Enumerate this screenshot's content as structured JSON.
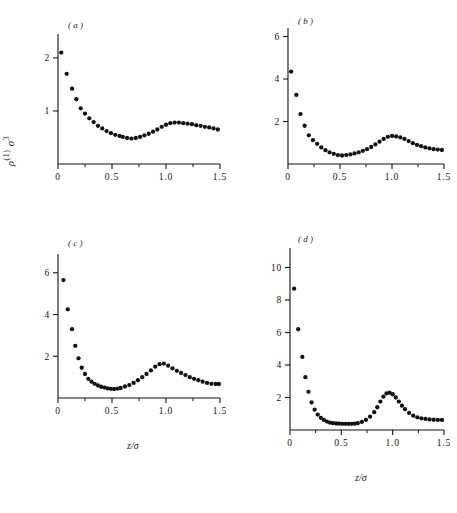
{
  "figure": {
    "ylabel_rho": "ρ",
    "ylabel_sup": "(1)",
    "ylabel_sigma": "σ",
    "ylabel_sigma_sup": "3",
    "xlabel_main": "z/σ",
    "background": "#ffffff",
    "ink": "#111111"
  },
  "chart_data": [
    {
      "type": "scatter",
      "panel": "(a)",
      "title": "",
      "xlabel": "z/σ",
      "ylabel": "ρ(1)σ3",
      "xlim": [
        0,
        1.5
      ],
      "ylim": [
        0,
        2.45
      ],
      "xticks": [
        0,
        0.5,
        1.0,
        1.5
      ],
      "xticklabels": [
        "0",
        "0.5",
        "1.0",
        "1.5"
      ],
      "xminorticks": [
        0.25,
        0.75,
        1.25
      ],
      "yticks": [
        1,
        2
      ],
      "yticklabels": [
        "1",
        "2"
      ],
      "grid": false,
      "legend": false,
      "x": [
        0.03,
        0.08,
        0.13,
        0.17,
        0.21,
        0.25,
        0.29,
        0.33,
        0.37,
        0.41,
        0.45,
        0.49,
        0.53,
        0.57,
        0.6,
        0.64,
        0.68,
        0.72,
        0.76,
        0.8,
        0.84,
        0.88,
        0.92,
        0.96,
        1.0,
        1.04,
        1.08,
        1.12,
        1.16,
        1.2,
        1.24,
        1.28,
        1.32,
        1.36,
        1.4,
        1.44,
        1.48
      ],
      "y": [
        2.1,
        1.7,
        1.42,
        1.22,
        1.05,
        0.95,
        0.86,
        0.79,
        0.72,
        0.67,
        0.62,
        0.58,
        0.55,
        0.53,
        0.51,
        0.49,
        0.48,
        0.49,
        0.51,
        0.54,
        0.57,
        0.61,
        0.65,
        0.7,
        0.74,
        0.77,
        0.78,
        0.78,
        0.77,
        0.76,
        0.75,
        0.73,
        0.72,
        0.7,
        0.69,
        0.67,
        0.65
      ]
    },
    {
      "type": "scatter",
      "panel": "(b)",
      "title": "",
      "xlabel": "z/σ",
      "ylabel": "ρ(1)σ3",
      "xlim": [
        0,
        1.5
      ],
      "ylim": [
        0,
        6.4
      ],
      "xticks": [
        0,
        0.5,
        1.0,
        1.5
      ],
      "xticklabels": [
        "0",
        "0.5",
        "1.0",
        "1.5"
      ],
      "xminorticks": [
        0.25,
        0.75,
        1.25
      ],
      "yticks": [
        2,
        4,
        6
      ],
      "yticklabels": [
        "2",
        "4",
        "6"
      ],
      "grid": false,
      "legend": false,
      "x": [
        0.03,
        0.08,
        0.12,
        0.16,
        0.2,
        0.24,
        0.28,
        0.32,
        0.36,
        0.4,
        0.44,
        0.48,
        0.52,
        0.56,
        0.6,
        0.64,
        0.68,
        0.72,
        0.76,
        0.8,
        0.84,
        0.88,
        0.92,
        0.96,
        1.0,
        1.04,
        1.08,
        1.12,
        1.16,
        1.2,
        1.24,
        1.28,
        1.32,
        1.36,
        1.4,
        1.44,
        1.48
      ],
      "y": [
        4.35,
        3.25,
        2.35,
        1.8,
        1.35,
        1.12,
        0.95,
        0.78,
        0.65,
        0.55,
        0.48,
        0.42,
        0.4,
        0.42,
        0.45,
        0.5,
        0.55,
        0.62,
        0.7,
        0.8,
        0.92,
        1.05,
        1.18,
        1.28,
        1.32,
        1.3,
        1.25,
        1.18,
        1.08,
        0.98,
        0.9,
        0.84,
        0.78,
        0.74,
        0.7,
        0.68,
        0.66
      ]
    },
    {
      "type": "scatter",
      "panel": "(c)",
      "title": "",
      "xlabel": "z/σ",
      "ylabel": "ρ(1)σ3",
      "xlim": [
        0,
        1.5
      ],
      "ylim": [
        0,
        6.9
      ],
      "xticks": [
        0,
        0.5,
        1.0,
        1.5
      ],
      "xticklabels": [
        "0",
        "0.5",
        "1.0",
        "1.5"
      ],
      "xminorticks": [
        0.25,
        0.75,
        1.25
      ],
      "yticks": [
        2,
        4,
        6
      ],
      "yticklabels": [
        "2",
        "4",
        "6"
      ],
      "grid": false,
      "legend": false,
      "x": [
        0.05,
        0.09,
        0.13,
        0.16,
        0.19,
        0.22,
        0.25,
        0.28,
        0.31,
        0.34,
        0.37,
        0.4,
        0.43,
        0.46,
        0.49,
        0.52,
        0.55,
        0.58,
        0.62,
        0.66,
        0.7,
        0.74,
        0.78,
        0.82,
        0.86,
        0.9,
        0.94,
        0.98,
        1.02,
        1.06,
        1.1,
        1.14,
        1.18,
        1.22,
        1.26,
        1.3,
        1.34,
        1.38,
        1.42,
        1.46,
        1.49
      ],
      "y": [
        5.65,
        4.25,
        3.3,
        2.5,
        1.9,
        1.45,
        1.15,
        0.92,
        0.78,
        0.68,
        0.6,
        0.54,
        0.5,
        0.46,
        0.44,
        0.43,
        0.45,
        0.48,
        0.55,
        0.62,
        0.72,
        0.85,
        1.0,
        1.15,
        1.32,
        1.5,
        1.62,
        1.65,
        1.55,
        1.42,
        1.3,
        1.2,
        1.1,
        1.0,
        0.92,
        0.85,
        0.78,
        0.72,
        0.68,
        0.67,
        0.67
      ]
    },
    {
      "type": "scatter",
      "panel": "(d)",
      "title": "",
      "xlabel": "z/σ",
      "ylabel": "ρ(1)σ3",
      "xlim": [
        0,
        1.5
      ],
      "ylim": [
        0,
        11.2
      ],
      "xticks": [
        0,
        0.5,
        1.0,
        1.5
      ],
      "xticklabels": [
        "0",
        "0.5",
        "1.0",
        "1.5"
      ],
      "xminorticks": [
        0.25,
        0.75,
        1.25
      ],
      "yticks": [
        2,
        4,
        6,
        8,
        10
      ],
      "yticklabels": [
        "2",
        "4",
        "6",
        "8",
        "10"
      ],
      "grid": false,
      "legend": false,
      "x": [
        0.04,
        0.08,
        0.12,
        0.15,
        0.18,
        0.21,
        0.24,
        0.27,
        0.3,
        0.33,
        0.36,
        0.39,
        0.42,
        0.45,
        0.48,
        0.51,
        0.54,
        0.57,
        0.6,
        0.63,
        0.66,
        0.7,
        0.74,
        0.78,
        0.82,
        0.85,
        0.88,
        0.91,
        0.94,
        0.97,
        1.0,
        1.03,
        1.06,
        1.09,
        1.12,
        1.16,
        1.2,
        1.24,
        1.28,
        1.32,
        1.36,
        1.4,
        1.44,
        1.48
      ],
      "y": [
        8.7,
        6.2,
        4.5,
        3.25,
        2.35,
        1.7,
        1.25,
        0.95,
        0.75,
        0.62,
        0.52,
        0.45,
        0.42,
        0.4,
        0.39,
        0.38,
        0.38,
        0.38,
        0.38,
        0.39,
        0.42,
        0.5,
        0.62,
        0.82,
        1.1,
        1.4,
        1.75,
        2.05,
        2.25,
        2.3,
        2.2,
        2.0,
        1.75,
        1.5,
        1.28,
        1.05,
        0.88,
        0.78,
        0.72,
        0.68,
        0.65,
        0.63,
        0.62,
        0.62
      ]
    }
  ]
}
